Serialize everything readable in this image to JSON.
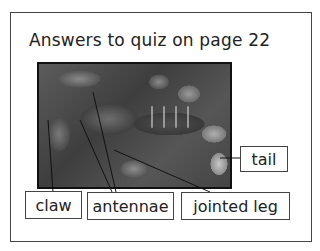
{
  "title": "Answers to quiz on page 22",
  "image": {
    "subject": "lobster-photo"
  },
  "labels": {
    "claw": "claw",
    "antennae": "antennae",
    "jointed_leg": "jointed leg",
    "tail": "tail"
  }
}
